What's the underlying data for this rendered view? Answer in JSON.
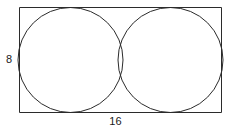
{
  "figure": {
    "type": "geometry-diagram",
    "background_color": "#ffffff",
    "stroke_color": "#2b2b2b",
    "stroke_width": 1,
    "text_color": "#1a1a1a"
  },
  "labels": {
    "height": "8",
    "width": "16"
  },
  "geometry": {
    "rectangle": {
      "x": 19,
      "y": 7,
      "width": 203,
      "height": 106
    },
    "circles": [
      {
        "name": "left-circle",
        "cx": 70.5,
        "cy": 60,
        "r": 52.5
      },
      {
        "name": "right-circle",
        "cx": 170.5,
        "cy": 60,
        "r": 52.5
      }
    ]
  },
  "chart_data": {
    "type": "diagram",
    "title": "",
    "shapes": [
      {
        "shape": "rectangle",
        "label_width": "16",
        "label_height": "8",
        "width_value": 16,
        "height_value": 8
      },
      {
        "shape": "circle",
        "position": "left",
        "diameter_value": 8,
        "radius_value": 4
      },
      {
        "shape": "circle",
        "position": "right",
        "diameter_value": 8,
        "radius_value": 4
      }
    ],
    "annotations": [
      "8",
      "16"
    ]
  }
}
